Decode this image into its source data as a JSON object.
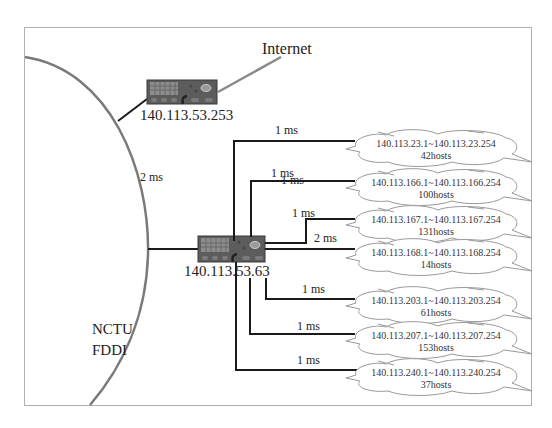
{
  "diagram": {
    "internet_label": "Internet",
    "fddi_label_line1": "NCTU",
    "fddi_label_line2": "FDDI",
    "fddi_link_latency": "2 ms",
    "routers": [
      {
        "id": "border-router",
        "ip": "140.113.53.253"
      },
      {
        "id": "core-router",
        "ip": "140.113.53.63"
      }
    ],
    "subnets": [
      {
        "range": "140.113.23.1~140.113.23.254",
        "hosts": "42hosts",
        "latency": "1 ms"
      },
      {
        "range": "140.113.166.1~140.113.166.254",
        "hosts": "100hosts",
        "latency": "1 ms",
        "overlap_latency": "1 ms"
      },
      {
        "range": "140.113.167.1~140.113.167.254",
        "hosts": "131hosts",
        "latency": "1 ms"
      },
      {
        "range": "140.113.168.1~140.113.168.254",
        "hosts": "14hosts",
        "latency": "2 ms"
      },
      {
        "range": "140.113.203.1~140.113.203.254",
        "hosts": "61hosts",
        "latency": "1 ms"
      },
      {
        "range": "140.113.207.1~140.113.207.254",
        "hosts": "153hosts",
        "latency": "1 ms"
      },
      {
        "range": "140.113.240.1~140.113.240.254",
        "hosts": "37hosts",
        "latency": "1 ms"
      }
    ],
    "colors": {
      "frame": "#b0b0b0",
      "ring": "#7a7a7a",
      "link": "#1a1a1a",
      "router_body": "#5c5c5c",
      "cloud": "#9a9a9a"
    }
  }
}
